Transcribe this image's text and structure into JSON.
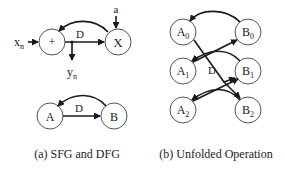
{
  "panel_a": {
    "caption": "(a) SFG and DFG",
    "sfg": {
      "adder_label": "+",
      "multiplier_label": "X",
      "input_label": "x",
      "input_sub": "n",
      "output_label": "y",
      "output_sub": "n",
      "coeff_label": "a",
      "delay_label": "D"
    },
    "dfg": {
      "node_a": "A",
      "node_b": "B",
      "delay_label": "D"
    }
  },
  "panel_b": {
    "caption": "(b) Unfolded Operation",
    "delay_label": "D",
    "nodes": [
      {
        "label": "A",
        "sub": "0"
      },
      {
        "label": "B",
        "sub": "0"
      },
      {
        "label": "A",
        "sub": "1"
      },
      {
        "label": "B",
        "sub": "1"
      },
      {
        "label": "A",
        "sub": "2"
      },
      {
        "label": "B",
        "sub": "2"
      }
    ]
  }
}
